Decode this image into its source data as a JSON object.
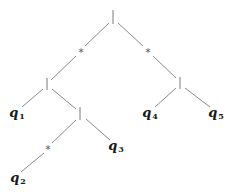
{
  "diagram": {
    "type": "tree",
    "colors": {
      "edge": "#8a8a8a",
      "operator": "#7a7a7a",
      "leaf_text": "#1a1a1a",
      "background": "#ffffff"
    },
    "nodes": {
      "root": {
        "op": "|",
        "x": 113,
        "y": 17
      },
      "star_left": {
        "op": "*",
        "x": 81,
        "y": 51
      },
      "star_right": {
        "op": "*",
        "x": 148,
        "y": 51
      },
      "alt_left": {
        "op": "|",
        "x": 47,
        "y": 84
      },
      "alt_right": {
        "op": "|",
        "x": 180,
        "y": 83
      },
      "alt_lower": {
        "op": "|",
        "x": 80,
        "y": 114
      },
      "star_lower": {
        "op": "*",
        "x": 48,
        "y": 148
      },
      "q1": {
        "base": "q",
        "sub": "1",
        "x": 17,
        "y": 113
      },
      "q2": {
        "base": "q",
        "sub": "2",
        "x": 18,
        "y": 178
      },
      "q3": {
        "base": "q",
        "sub": "3",
        "x": 116,
        "y": 146
      },
      "q4": {
        "base": "q",
        "sub": "4",
        "x": 150,
        "y": 113
      },
      "q5": {
        "base": "q",
        "sub": "5",
        "x": 216,
        "y": 113
      }
    },
    "edges": [
      [
        "root",
        "star_left"
      ],
      [
        "root",
        "star_right"
      ],
      [
        "star_left",
        "alt_left"
      ],
      [
        "star_right",
        "alt_right"
      ],
      [
        "alt_left",
        "q1"
      ],
      [
        "alt_left",
        "alt_lower"
      ],
      [
        "alt_lower",
        "star_lower"
      ],
      [
        "alt_lower",
        "q3"
      ],
      [
        "star_lower",
        "q2"
      ],
      [
        "alt_right",
        "q4"
      ],
      [
        "alt_right",
        "q5"
      ]
    ]
  },
  "labels": {
    "star_left": "*",
    "star_right": "*",
    "star_lower": "*",
    "q1": {
      "base": "q",
      "sub": "1"
    },
    "q2": {
      "base": "q",
      "sub": "2"
    },
    "q3": {
      "base": "q",
      "sub": "3"
    },
    "q4": {
      "base": "q",
      "sub": "4"
    },
    "q5": {
      "base": "q",
      "sub": "5"
    }
  }
}
